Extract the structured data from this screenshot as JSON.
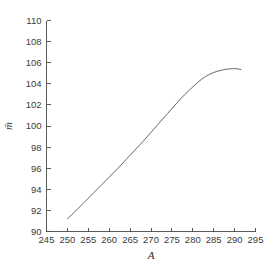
{
  "chart_data": {
    "type": "line",
    "title": "",
    "subtitle": "",
    "xlabel": "A",
    "ylabel": "m̄",
    "xlim": [
      245,
      295
    ],
    "ylim": [
      90,
      110
    ],
    "xticks": [
      245,
      250,
      255,
      260,
      265,
      270,
      275,
      280,
      285,
      290,
      295
    ],
    "yticks": [
      90,
      92,
      94,
      96,
      98,
      100,
      102,
      104,
      106,
      108,
      110
    ],
    "xtick_labels": [
      "245",
      "250",
      "255",
      "260",
      "265",
      "270",
      "275",
      "280",
      "285",
      "290",
      "295"
    ],
    "ytick_labels": [
      "90",
      "92",
      "94",
      "96",
      "98",
      "100",
      "102",
      "104",
      "106",
      "108",
      "110"
    ],
    "grid": false,
    "legend": null,
    "legend_position": "none",
    "line_color": "#555555",
    "axis_color": "#4a4a4a",
    "background_color": "#ffffff",
    "series": [
      {
        "name": "m-bar vs A",
        "x": [
          250.0,
          252.0,
          254.0,
          256.0,
          258.0,
          260.0,
          262.0,
          264.0,
          266.0,
          268.0,
          270.0,
          272.0,
          274.0,
          276.0,
          278.0,
          280.0,
          282.0,
          284.0,
          286.0,
          288.0,
          289.5,
          290.5,
          291.5
        ],
        "y": [
          91.2,
          91.95,
          92.75,
          93.55,
          94.35,
          95.15,
          95.95,
          96.8,
          97.65,
          98.5,
          99.4,
          100.3,
          101.2,
          102.1,
          102.95,
          103.7,
          104.4,
          104.9,
          105.2,
          105.38,
          105.43,
          105.43,
          105.35
        ]
      }
    ]
  },
  "axes": {
    "x_axis_name": "A",
    "y_axis_name": "m-bar"
  }
}
